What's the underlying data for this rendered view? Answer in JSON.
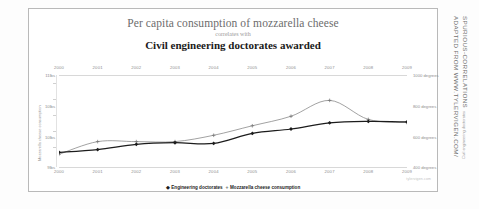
{
  "chart_data": {
    "type": "line",
    "title": "Per capita consumption of mozzarella cheese",
    "correlates_with": "correlates with",
    "subtitle": "Civil engineering doctorates awarded",
    "x": [
      2000,
      2001,
      2002,
      2003,
      2004,
      2005,
      2006,
      2007,
      2008,
      2009
    ],
    "x_tick_labels": [
      "2000",
      "2001",
      "2002",
      "2003",
      "2004",
      "2005",
      "2006",
      "2007",
      "2008",
      "2009"
    ],
    "xlabel": "",
    "grid": false,
    "legend_position": "bottom",
    "series": [
      {
        "name": "Engineering doctorates",
        "axis": "right",
        "color": "#1c1c1c",
        "marker": "diamond",
        "values": [
          480,
          501,
          540,
          552,
          547,
          622,
          655,
          701,
          712,
          708
        ],
        "unit": "degrees"
      },
      {
        "name": "Mozzarella cheese consumption",
        "axis": "left",
        "color": "#6f6f6f",
        "marker": "plus",
        "values": [
          9.3,
          9.7,
          9.7,
          9.7,
          9.9,
          10.2,
          10.5,
          11.0,
          10.4,
          10.3
        ],
        "unit": "lbs"
      }
    ],
    "yaxis_left": {
      "label": "Mozzarella cheese consumption",
      "tick_labels": [
        "11lbs",
        "10lbs",
        "10lbs",
        "9lbs"
      ],
      "tick_values": [
        11.5,
        10.8,
        10.1,
        9.1
      ],
      "ylim": [
        8.9,
        11.8
      ]
    },
    "yaxis_right": {
      "label": "Civil engineering doctorates",
      "tick_labels": [
        "1000 degrees",
        "800 degrees",
        "600 degrees",
        "400 degrees"
      ],
      "tick_values": [
        1000,
        800,
        600,
        400
      ],
      "ylim": [
        370,
        1060
      ]
    }
  },
  "legend": {
    "items": [
      {
        "label": "Engineering doctorates",
        "marker": "◆"
      },
      {
        "label": "Mozzarella cheese consumption",
        "marker": "+"
      }
    ]
  },
  "source_note": "tylervigen.com",
  "attribution": {
    "line1": "ADAPTED FROM WWW.TYLERVIGEN.COM/",
    "line2": "SPURIOUS-CORRELATIONS"
  }
}
